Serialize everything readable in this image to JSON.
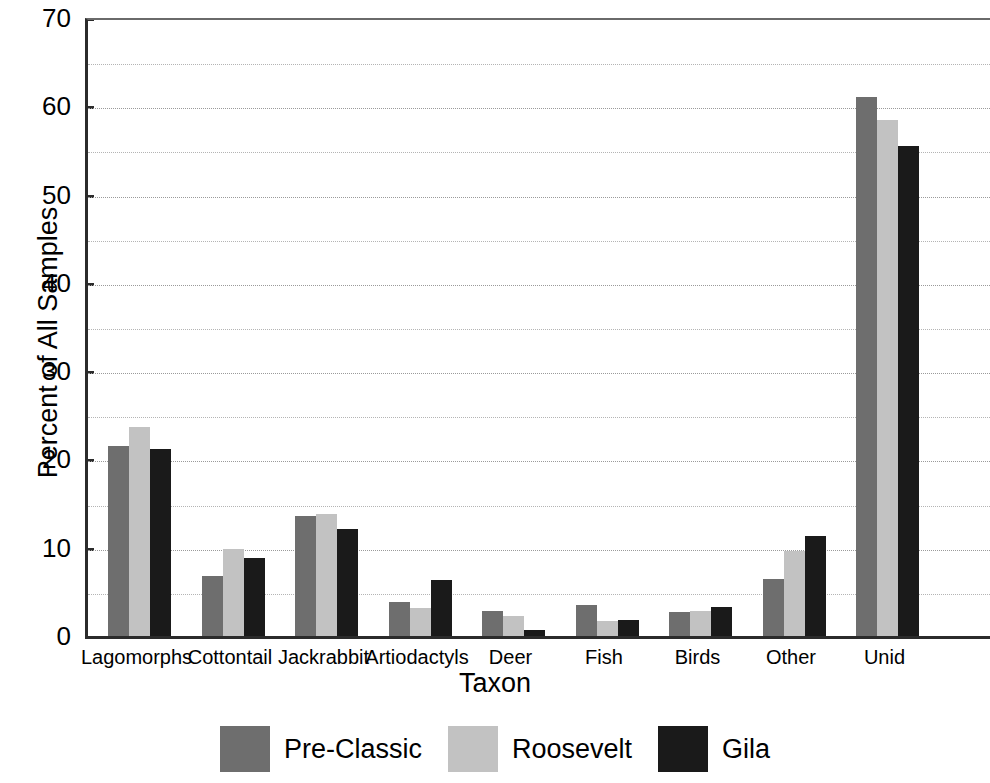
{
  "chart_data": {
    "type": "bar",
    "title": "",
    "xlabel": "Taxon",
    "ylabel": "Percent of All Samples",
    "ylim": [
      0,
      70
    ],
    "ytick_step": 10,
    "minor_grid_step": 5,
    "grid": true,
    "legend_position": "bottom",
    "categories": [
      "Lagomorphs",
      "Cottontail",
      "Jackrabbit",
      "Artiodactyls",
      "Deer",
      "Fish",
      "Birds",
      "Other",
      "Unid"
    ],
    "series": [
      {
        "name": "Pre-Classic",
        "color": "#6e6e6e",
        "values": [
          21.5,
          6.8,
          13.6,
          3.9,
          2.8,
          3.5,
          2.7,
          6.5,
          61.0
        ]
      },
      {
        "name": "Roosevelt",
        "color": "#c2c2c2",
        "values": [
          23.7,
          9.8,
          13.8,
          3.2,
          2.3,
          1.7,
          2.8,
          9.6,
          58.5
        ]
      },
      {
        "name": "Gila",
        "color": "#1a1a1a",
        "values": [
          21.2,
          8.8,
          12.1,
          6.4,
          0.7,
          1.8,
          3.3,
          11.3,
          55.5
        ]
      }
    ],
    "ytick_labels": [
      "0",
      "10",
      "20",
      "30",
      "40",
      "50",
      "60",
      "70"
    ],
    "ytick_values": [
      0,
      10,
      20,
      30,
      40,
      50,
      60,
      70
    ]
  },
  "colors": {
    "axis": "#2b2b2b",
    "grid": "#b4b4b4",
    "background": "#ffffff",
    "text": "#000000"
  }
}
